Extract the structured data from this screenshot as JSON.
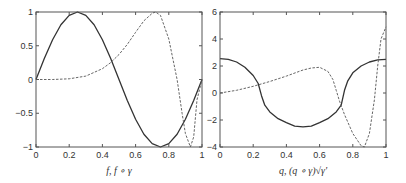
{
  "chart_data": [
    {
      "type": "line",
      "xlabel": "f, f ∘ γ",
      "ylabel": "",
      "xlim": [
        0,
        1
      ],
      "ylim": [
        -1,
        1
      ],
      "xticks": [
        "0",
        "0.2",
        "0.4",
        "0.6",
        "0.8",
        "1"
      ],
      "yticks": [
        "-1",
        "-0.5",
        "0",
        "0.5",
        "1"
      ],
      "grid": false,
      "series": [
        {
          "name": "f",
          "style": "solid",
          "x": [
            0,
            0.05,
            0.1,
            0.15,
            0.2,
            0.25,
            0.3,
            0.35,
            0.4,
            0.45,
            0.5,
            0.55,
            0.6,
            0.65,
            0.7,
            0.75,
            0.8,
            0.85,
            0.9,
            0.95,
            1
          ],
          "y": [
            0,
            0.31,
            0.59,
            0.81,
            0.95,
            1,
            0.95,
            0.81,
            0.59,
            0.31,
            0,
            -0.31,
            -0.59,
            -0.81,
            -0.95,
            -1,
            -0.95,
            -0.81,
            -0.59,
            -0.31,
            0
          ]
        },
        {
          "name": "f ∘ γ",
          "style": "dashed",
          "x": [
            0,
            0.1,
            0.2,
            0.3,
            0.4,
            0.45,
            0.5,
            0.55,
            0.6,
            0.65,
            0.7,
            0.72,
            0.75,
            0.8,
            0.85,
            0.88,
            0.9,
            0.93,
            0.95,
            0.97,
            1
          ],
          "y": [
            0,
            0.0,
            0.01,
            0.05,
            0.16,
            0.25,
            0.37,
            0.52,
            0.7,
            0.87,
            0.98,
            1,
            0.95,
            0.6,
            0.0,
            -0.5,
            -0.8,
            -1,
            -0.85,
            -0.3,
            0
          ]
        }
      ]
    },
    {
      "type": "line",
      "xlabel": "q, (q ∘ γ)√γ'",
      "ylabel": "",
      "xlim": [
        0,
        1
      ],
      "ylim": [
        -4,
        6
      ],
      "xticks": [
        "0",
        "0.2",
        "0.4",
        "0.6",
        "0.8",
        "1"
      ],
      "yticks": [
        "-4",
        "-2",
        "0",
        "2",
        "4",
        "6"
      ],
      "grid": false,
      "series": [
        {
          "name": "q",
          "style": "solid",
          "x": [
            0,
            0.05,
            0.1,
            0.15,
            0.2,
            0.23,
            0.25,
            0.27,
            0.3,
            0.35,
            0.4,
            0.45,
            0.5,
            0.55,
            0.6,
            0.65,
            0.7,
            0.73,
            0.75,
            0.77,
            0.8,
            0.85,
            0.9,
            0.95,
            1
          ],
          "y": [
            2.55,
            2.5,
            2.3,
            1.9,
            1.3,
            0.7,
            -0.2,
            -0.9,
            -1.4,
            -1.9,
            -2.2,
            -2.45,
            -2.5,
            -2.45,
            -2.2,
            -1.9,
            -1.4,
            -0.9,
            0.2,
            0.9,
            1.5,
            2.0,
            2.3,
            2.45,
            2.5
          ]
        },
        {
          "name": "(q ∘ γ)√γ'",
          "style": "dashed",
          "x": [
            0,
            0.1,
            0.2,
            0.3,
            0.4,
            0.5,
            0.55,
            0.6,
            0.65,
            0.68,
            0.7,
            0.72,
            0.75,
            0.8,
            0.85,
            0.87,
            0.9,
            0.93,
            0.95,
            0.97,
            1
          ],
          "y": [
            0,
            0.2,
            0.5,
            0.85,
            1.25,
            1.7,
            1.85,
            1.9,
            1.6,
            1.0,
            0.2,
            -0.6,
            -1.6,
            -3.0,
            -3.9,
            -4,
            -3.0,
            -0.5,
            2.0,
            4.0,
            4.9
          ]
        }
      ]
    }
  ]
}
